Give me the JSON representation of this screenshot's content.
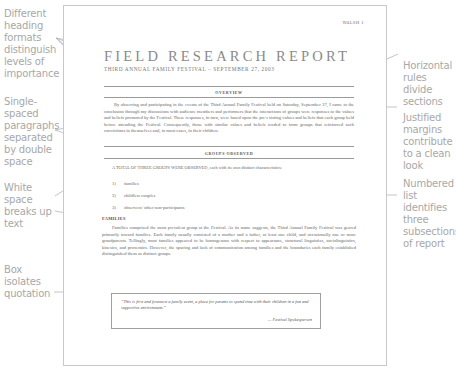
{
  "callouts": {
    "left": [
      {
        "id": "heading-formats",
        "text": "Different heading formats distinguish levels of importance"
      },
      {
        "id": "single-spaced",
        "text": "Single-spaced paragraphs separated by double space"
      },
      {
        "id": "white-space",
        "text": "White space breaks up text"
      },
      {
        "id": "box-quotation",
        "text": "Box isolates quotation"
      }
    ],
    "right": [
      {
        "id": "horizontal-rules",
        "text": "Horizontal rules divide sections"
      },
      {
        "id": "justified-margins",
        "text": "Justified margins contribute to a clean look"
      },
      {
        "id": "numbered-list",
        "text": "Numbered list identifies three subsections of report"
      }
    ]
  },
  "document": {
    "running_head": "WALSH 1",
    "title": "FIELD RESEARCH REPORT",
    "subtitle": "THIRD ANNUAL FAMILY FESTIVAL – SEPTEMBER 27, 2003",
    "overview": {
      "heading": "OVERVIEW",
      "text": "By observing and participating in the events of the Third Annual Family Festival held on Saturday, September 27, I came to the conclusion through my discussions with audience members and performers that the interactions of groups were responses to the values and beliefs promoted by the Festival. These responses, in turn, were based upon the pre-existing values and beliefs that each group held before attending the Festival. Consequently, those with similar values and beliefs tended to form groups that reinforced such convictions in themselves and, in most cases, in their children."
    },
    "groups": {
      "heading": "GROUPS OBSERVED",
      "lead": "A TOTAL OF THREE GROUPS WERE OBSERVED, each with its own distinct characteristics:",
      "items": [
        {
          "num": "1)",
          "label": "families"
        },
        {
          "num": "2)",
          "label": "childless couples"
        },
        {
          "num": "3)",
          "label": "observers/ other non-participants"
        }
      ]
    },
    "families": {
      "heading": "FAMILIES",
      "text": "Families comprised the most prevalent group at the Festival. As its name suggests, the Third Annual Family Festival was geared primarily toward families. Each family usually consisted of a mother and a father, at least one child, and occasionally one or more grandparents. Tellingly, most families appeared to be homogenous with respect to appearance, structural linguistics, sociolinguistics, kinesics, and proxemics. However, the spacing and lack of communication among families and the boundaries each family established distinguished them as distinct groups."
    },
    "quote": {
      "text": "“This is first and foremost a family event, a place for parents to spend time with their children in a fun and supportive environment.”",
      "attribution": "— Festival Spokesperson"
    }
  },
  "colors": {
    "callout_text": "#a8a8a8",
    "leader_line": "#b5b5b5",
    "page_border": "#c8c8c8",
    "rule": "#9a9a9a",
    "body_text": "#666666"
  }
}
